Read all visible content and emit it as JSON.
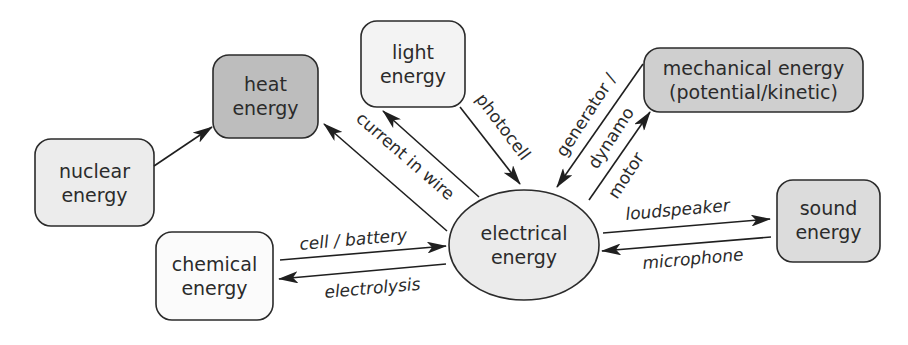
{
  "diagram": {
    "colors": {
      "nuclear_fill": "#ececec",
      "heat_fill": "#bdbdbd",
      "light_fill": "#f3f3f3",
      "mechanical_fill": "#cfcfcf",
      "sound_fill": "#dcdcdc",
      "chemical_fill": "#fbfbfb",
      "electrical_fill": "#ebebeb",
      "stroke": "#2b2b2b"
    },
    "nodes": {
      "nuclear": {
        "line1": "nuclear",
        "line2": "energy"
      },
      "heat": {
        "line1": "heat",
        "line2": "energy"
      },
      "light": {
        "line1": "light",
        "line2": "energy"
      },
      "mechanical": {
        "line1": "mechanical energy",
        "line2": "(potential/kinetic)"
      },
      "sound": {
        "line1": "sound",
        "line2": "energy"
      },
      "chemical": {
        "line1": "chemical",
        "line2": "energy"
      },
      "electrical": {
        "line1": "electrical",
        "line2": "energy"
      }
    },
    "edges": {
      "nuclear_to_heat": "",
      "current_in_wire": "current in wire",
      "photocell": "photocell",
      "generator_dynamo_line1": "generator /",
      "generator_dynamo_line2": "dynamo",
      "motor": "motor",
      "loudspeaker": "loudspeaker",
      "microphone": "microphone",
      "cell_battery": "cell / battery",
      "electrolysis": "electrolysis"
    }
  }
}
